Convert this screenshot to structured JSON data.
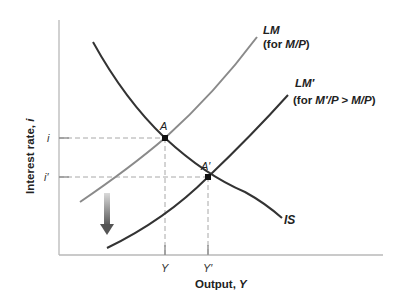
{
  "diagram": {
    "colors": {
      "axis": "#b8b8b8",
      "lm": "#8a8a8a",
      "lm_prime": "#333333",
      "is": "#333333",
      "dashed": "#a8a8a8",
      "point": "#111111",
      "arrow_top": "#d8d8d8",
      "arrow_bottom": "#555555"
    },
    "axes": {
      "y_label": "Interest rate, ",
      "y_label_var": "i",
      "x_label": "Output, ",
      "x_label_var": "Y"
    },
    "ticks": {
      "y": [
        {
          "label": "i",
          "y": 138
        },
        {
          "label": "i′",
          "y": 177
        }
      ],
      "x": [
        {
          "label": "Y",
          "x": 165
        },
        {
          "label": "Y′",
          "x": 208
        }
      ]
    },
    "curves": {
      "lm": {
        "name": "LM",
        "note_prefix": "(for ",
        "note_var": "M/P",
        "note_suffix": ")"
      },
      "lm_prime": {
        "name": "LM′",
        "note_prefix": "(for ",
        "note_var": "M′/P > M/P",
        "note_suffix": ")"
      },
      "is": {
        "name": "IS"
      }
    },
    "points": [
      {
        "label": "A",
        "x": 165,
        "y": 138
      },
      {
        "label": "A′",
        "x": 208,
        "y": 177
      }
    ],
    "shift_arrow": {
      "direction": "down"
    }
  }
}
